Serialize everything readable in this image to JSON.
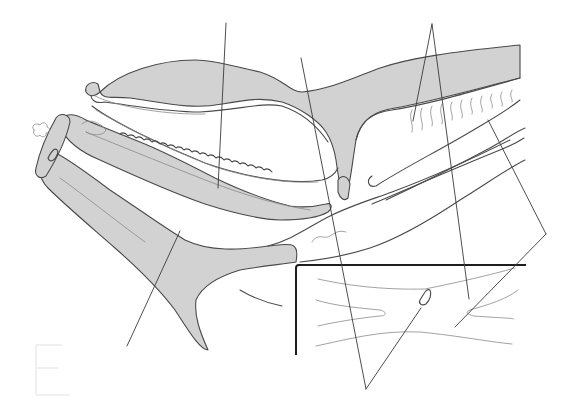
{
  "figure": {
    "title": "",
    "labels": [],
    "leader_line_count": 9,
    "colors": {
      "tissue_fill": "#d2d2d2",
      "outline": "#4a4a4a",
      "leader": "#3a3a3a",
      "inset_frame": "#1e1e1e",
      "background": "#ffffff"
    },
    "inset": {
      "present": true,
      "position": "bottom-right"
    }
  }
}
